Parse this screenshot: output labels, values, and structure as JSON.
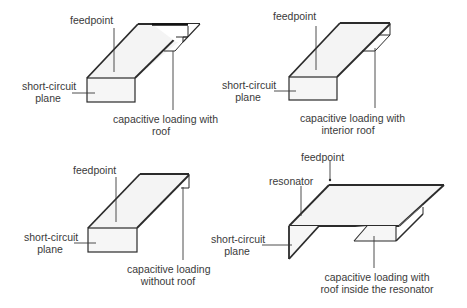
{
  "figure": {
    "panels": [
      {
        "id": "top-left",
        "labels": {
          "feedpoint": "feedpoint",
          "short_circuit_line1": "short-circuit",
          "short_circuit_line2": "plane",
          "loading_line1": "capacitive loading with",
          "loading_line2": "roof"
        }
      },
      {
        "id": "top-right",
        "labels": {
          "feedpoint": "feedpoint",
          "short_circuit_line1": "short-circuit",
          "short_circuit_line2": "plane",
          "loading_line1": "capacitive loading with",
          "loading_line2": "interior roof"
        }
      },
      {
        "id": "bottom-left",
        "labels": {
          "feedpoint": "feedpoint",
          "short_circuit_line1": "short-circuit",
          "short_circuit_line2": "plane",
          "loading_line1": "capacitive loading",
          "loading_line2": "without roof"
        }
      },
      {
        "id": "bottom-right",
        "labels": {
          "feedpoint": "feedpoint",
          "resonator": "resonator",
          "short_circuit_line1": "short-circuit",
          "short_circuit_line2": "plane",
          "loading_line1": "capacitive loading with",
          "loading_line2": "roof inside the resonator"
        }
      }
    ],
    "colors": {
      "stroke": "#2b2b2b",
      "leader": "#3a3a3a",
      "fill": "#f4f4f4",
      "text": "#3a3a3a"
    }
  }
}
